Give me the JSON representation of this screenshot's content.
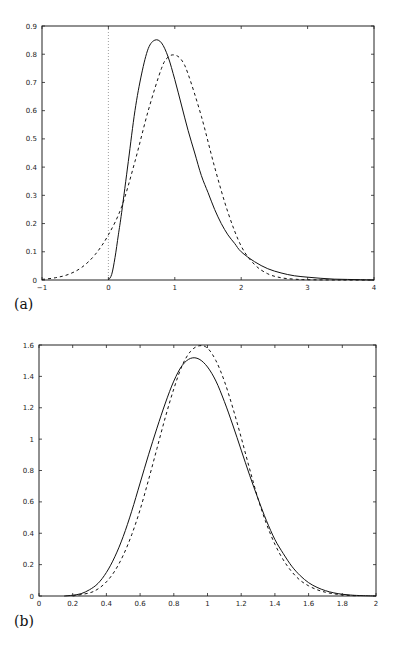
{
  "chart_data": [
    {
      "type": "line",
      "panel_label": "(a)",
      "title": "",
      "xlabel": "",
      "ylabel": "",
      "xlim": [
        -1,
        4
      ],
      "ylim": [
        0,
        0.9
      ],
      "xticks": [
        -1,
        0,
        1,
        2,
        3,
        4
      ],
      "xtick_labels": [
        "-1",
        "0",
        "1",
        "2",
        "3",
        "4"
      ],
      "yticks": [
        0,
        0.1,
        0.2,
        0.3,
        0.4,
        0.5,
        0.6,
        0.7,
        0.8,
        0.9
      ],
      "ytick_labels": [
        "0",
        "0.1",
        "0.2",
        "0.3",
        "0.4",
        "0.5",
        "0.6",
        "0.7",
        "0.8",
        "0.9"
      ],
      "grid": false,
      "legend": null,
      "annotations": [
        {
          "type": "vline",
          "x": 0,
          "style": "dotted"
        }
      ],
      "series": [
        {
          "name": "solid",
          "style": "solid",
          "x": [
            0,
            0.05,
            0.1,
            0.15,
            0.2,
            0.3,
            0.4,
            0.5,
            0.6,
            0.7,
            0.8,
            0.9,
            1.0,
            1.1,
            1.2,
            1.3,
            1.4,
            1.5,
            1.6,
            1.7,
            1.8,
            1.9,
            2.0,
            2.2,
            2.4,
            2.6,
            2.8,
            3.0,
            3.2,
            3.4,
            3.6,
            3.8,
            4.0
          ],
          "values": [
            0,
            0.02,
            0.08,
            0.16,
            0.24,
            0.42,
            0.6,
            0.73,
            0.82,
            0.85,
            0.84,
            0.79,
            0.71,
            0.62,
            0.53,
            0.45,
            0.37,
            0.31,
            0.25,
            0.2,
            0.16,
            0.13,
            0.1,
            0.065,
            0.04,
            0.025,
            0.015,
            0.01,
            0.006,
            0.003,
            0.002,
            0.001,
            0
          ]
        },
        {
          "name": "dashed",
          "style": "dashed",
          "x": [
            -1,
            -0.8,
            -0.6,
            -0.4,
            -0.2,
            0,
            0.2,
            0.4,
            0.6,
            0.8,
            0.9,
            1.0,
            1.1,
            1.2,
            1.4,
            1.6,
            1.8,
            2.0,
            2.2,
            2.4,
            2.6,
            2.8,
            3.0,
            3.5,
            4.0
          ],
          "values": [
            0.002,
            0.008,
            0.02,
            0.045,
            0.09,
            0.16,
            0.26,
            0.42,
            0.6,
            0.75,
            0.79,
            0.797,
            0.78,
            0.73,
            0.58,
            0.4,
            0.24,
            0.12,
            0.055,
            0.022,
            0.008,
            0.003,
            0.001,
            0,
            0
          ]
        }
      ]
    },
    {
      "type": "line",
      "panel_label": "(b)",
      "title": "",
      "xlabel": "",
      "ylabel": "",
      "xlim": [
        0,
        2
      ],
      "ylim": [
        0,
        1.6
      ],
      "xticks": [
        0,
        0.2,
        0.4,
        0.6,
        0.8,
        1,
        1.2,
        1.4,
        1.6,
        1.8,
        2
      ],
      "xtick_labels": [
        "0",
        "0.2",
        "0.4",
        "0.6",
        "0.8",
        "1",
        "1.2",
        "1.4",
        "1.6",
        "1.8",
        "2"
      ],
      "yticks": [
        0,
        0.2,
        0.4,
        0.6,
        0.8,
        1,
        1.2,
        1.4,
        1.6
      ],
      "ytick_labels": [
        "0",
        "0.2",
        "0.4",
        "0.6",
        "0.8",
        "1",
        "1.2",
        "1.4",
        "1.6"
      ],
      "grid": false,
      "legend": null,
      "annotations": [],
      "series": [
        {
          "name": "solid",
          "style": "solid",
          "x": [
            0.15,
            0.2,
            0.25,
            0.3,
            0.35,
            0.4,
            0.45,
            0.5,
            0.55,
            0.6,
            0.65,
            0.7,
            0.75,
            0.8,
            0.85,
            0.9,
            0.95,
            1.0,
            1.05,
            1.1,
            1.15,
            1.2,
            1.25,
            1.3,
            1.35,
            1.4,
            1.45,
            1.5,
            1.55,
            1.6,
            1.65,
            1.7,
            1.75,
            1.8,
            1.85,
            1.9,
            2.0
          ],
          "values": [
            0,
            0.005,
            0.015,
            0.04,
            0.08,
            0.15,
            0.25,
            0.38,
            0.54,
            0.72,
            0.9,
            1.07,
            1.23,
            1.37,
            1.47,
            1.515,
            1.51,
            1.46,
            1.37,
            1.24,
            1.09,
            0.93,
            0.77,
            0.62,
            0.48,
            0.36,
            0.27,
            0.19,
            0.13,
            0.085,
            0.055,
            0.034,
            0.02,
            0.011,
            0.006,
            0.003,
            0
          ]
        },
        {
          "name": "dashed",
          "style": "dashed",
          "x": [
            0.2,
            0.3,
            0.35,
            0.4,
            0.45,
            0.5,
            0.55,
            0.6,
            0.65,
            0.7,
            0.75,
            0.8,
            0.85,
            0.9,
            0.95,
            1.0,
            1.05,
            1.1,
            1.15,
            1.2,
            1.25,
            1.3,
            1.35,
            1.4,
            1.45,
            1.5,
            1.55,
            1.6,
            1.65,
            1.7,
            1.75,
            1.8,
            1.85,
            1.9
          ],
          "values": [
            0,
            0.02,
            0.045,
            0.09,
            0.16,
            0.26,
            0.39,
            0.55,
            0.74,
            0.94,
            1.14,
            1.32,
            1.47,
            1.56,
            1.595,
            1.58,
            1.5,
            1.37,
            1.2,
            1.01,
            0.81,
            0.62,
            0.46,
            0.33,
            0.23,
            0.155,
            0.1,
            0.065,
            0.04,
            0.024,
            0.014,
            0.007,
            0.003,
            0.001
          ]
        }
      ]
    }
  ]
}
